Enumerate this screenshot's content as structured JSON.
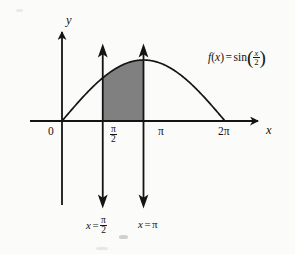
{
  "figure": {
    "background_color": "#fbfbf9",
    "ink_color": "#141414",
    "shade_color": "#808080"
  },
  "axes": {
    "x_label": "x",
    "y_label": "y",
    "origin_label": "0"
  },
  "ticks": {
    "pi_over_2": {
      "numerator": "π",
      "denominator": "2"
    },
    "pi": "π",
    "two_pi": "2π"
  },
  "function_label": {
    "lhs": "f",
    "arg_open": "(",
    "arg": "x",
    "arg_close": ")",
    "equals": "=",
    "fname": "sin",
    "paren_open": "(",
    "frac_num": "x",
    "frac_den": "2",
    "paren_close": ")",
    "plain": "f(x) = sin(x/2)"
  },
  "vertical_lines": [
    {
      "name": "x = pi/2",
      "label_prefix": "x",
      "label_equals": "=",
      "label_num": "π",
      "label_den": "2",
      "plain": "x = π/2"
    },
    {
      "name": "x = pi",
      "label_prefix": "x",
      "label_equals": "=",
      "label_value": "π",
      "plain": "x = π"
    }
  ],
  "chart_data": {
    "type": "line",
    "xlabel": "x",
    "ylabel": "y",
    "function": "sin(x/2)",
    "xlim": [
      0,
      7.3303
    ],
    "ylim": [
      -1.0,
      1.25
    ],
    "grid": false,
    "legend": "none",
    "x_ticks": [
      0,
      1.5708,
      3.1416,
      6.2832
    ],
    "x_tick_labels": [
      "0",
      "π/2",
      "π",
      "2π"
    ],
    "y_ticks": [],
    "y_tick_labels": [],
    "series": [
      {
        "name": "f(x) = sin(x/2)",
        "x": [
          0,
          0.3927,
          0.7854,
          1.1781,
          1.5708,
          1.9635,
          2.3562,
          2.7489,
          3.1416,
          3.5343,
          3.927,
          4.3197,
          4.7124,
          5.1051,
          5.4978,
          5.8905,
          6.2832
        ],
        "y": [
          0.0,
          0.1951,
          0.3827,
          0.5556,
          0.7071,
          0.8315,
          0.9239,
          0.9808,
          1.0,
          0.9808,
          0.9239,
          0.8315,
          0.7071,
          0.5556,
          0.3827,
          0.1951,
          0.0
        ]
      }
    ],
    "shaded_region": {
      "label": "area under curve",
      "x_from": 1.5708,
      "x_to": 3.1416,
      "x_from_label": "π/2",
      "x_to_label": "π",
      "fill": "#808080"
    },
    "annotations": [
      {
        "text": "x = π/2",
        "x": 1.5708,
        "type": "vertical-line"
      },
      {
        "text": "x = π",
        "x": 3.1416,
        "type": "vertical-line"
      },
      {
        "text": "f(x) = sin(x/2)",
        "x": 5.6,
        "y": 1.15,
        "type": "curve-label"
      }
    ]
  }
}
